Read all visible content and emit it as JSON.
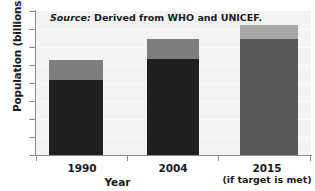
{
  "chart_data": {
    "type": "bar",
    "subtype": "stacked-bar",
    "title": "",
    "xlabel": "Year",
    "ylabel": "Population (billions)",
    "categories": [
      "1990",
      "2004",
      "2015"
    ],
    "category_sublabels": [
      "",
      "",
      "(if target is met)"
    ],
    "ylim": [
      0,
      8
    ],
    "yticks": [
      0,
      1,
      2,
      3,
      4,
      5,
      6,
      7,
      8
    ],
    "ytick_labels": [
      "0",
      "1",
      "2",
      "3",
      "4",
      "5",
      "6",
      "7",
      "8"
    ],
    "grid": true,
    "legend": "none",
    "series": [
      {
        "name": "lower-segment",
        "values": [
          4.15,
          5.35,
          6.45
        ]
      },
      {
        "name": "upper-segment",
        "values": [
          1.15,
          1.1,
          0.8
        ]
      }
    ],
    "totals": [
      5.3,
      6.45,
      7.25
    ],
    "annotations": [
      "Source: Derived from WHO and UNICEF."
    ],
    "colors": {
      "bar1_lower": "#1f1f1f",
      "bar1_upper": "#7d7d7d",
      "bar2_lower": "#1f1f1f",
      "bar2_upper": "#7d7d7d",
      "bar3_lower": "#595959",
      "bar3_upper": "#a8a8a8",
      "plot_background": "#f3f3f3",
      "axis": "#8a8a8a",
      "text": "#1a1a1a"
    }
  },
  "axes": {
    "y_title": "Population (billions)",
    "x_title": "Year",
    "y_ticks": [
      "0",
      "1",
      "2",
      "3",
      "4",
      "5",
      "6",
      "7",
      "8"
    ],
    "x_labels": [
      {
        "main": "1990",
        "sub": ""
      },
      {
        "main": "2004",
        "sub": ""
      },
      {
        "main": "2015",
        "sub": "(if target is met)"
      }
    ]
  },
  "note": {
    "prefix": "Source:",
    "text": " Derived from WHO and UNICEF."
  }
}
